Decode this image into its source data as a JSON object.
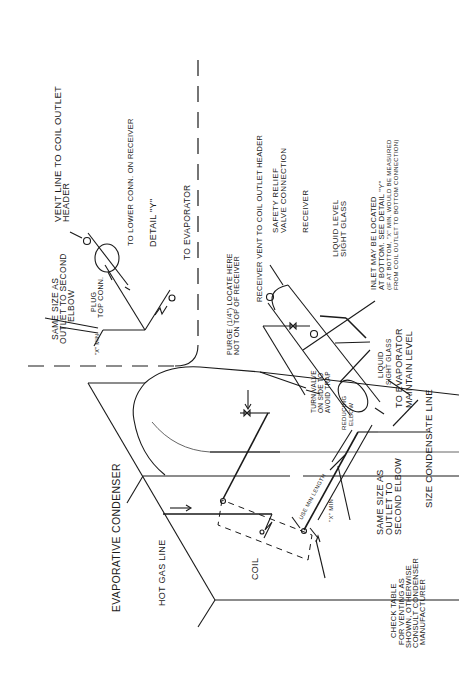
{
  "diagram": {
    "orientation": "rotated 90 degrees counter-clockwise",
    "labels": {
      "evaporative_condenser": "EVAPORATIVE CONDENSER",
      "hot_gas_line": "HOT GAS LINE",
      "coil": "COIL",
      "check_table": [
        "CHECK TABLE",
        "FOR VENTING AS",
        "SHOWN, OTHERWISE",
        "CONSULT CONDENSER",
        "MANUFACTURER"
      ],
      "same_size_bottom": [
        "SAME SIZE AS",
        "OUTLET TO",
        "SECOND ELBOW"
      ],
      "size_condensate_line": "SIZE CONDENSATE LINE",
      "use_min_length": "USE MIN LENGTH",
      "x_min_bottom": "\"X\" MIN",
      "reducing_elbow": [
        "REDUCING",
        "ELBOW"
      ],
      "turn_valve": [
        "TURN VALVE",
        "ON SIDE TO",
        "AVOID TRAP"
      ],
      "liquid_sight_glass": [
        "LIQUID",
        "SIGHT GLASS"
      ],
      "to_evaporator_maintain": [
        "TO EVAPORATOR",
        "MAINTAIN LEVEL"
      ],
      "purge": [
        "PURGE (1/4\") LOCATE HERE",
        "NOT ON TOP OF RECEIVER"
      ],
      "receiver_vent": "RECEIVER VENT TO COIL OUTLET HEADER",
      "safety_relief": [
        "SAFETY RELIEF",
        "VALVE CONNECTION"
      ],
      "receiver": "RECEIVER",
      "liquid_level_sight_glass": [
        "LIQUID LEVEL",
        "SIGHT GLASS"
      ],
      "inlet_note": [
        "INLET MAY BE LOCATED",
        "AT BOTTOM. SEE DETAIL \"Y\"",
        "(IF AT BOTTOM, \"X\" MIN. WOULD BE MEASURED",
        "FROM COIL OUTLET TO BOTTOM CONNECTION)"
      ],
      "vent_line": [
        "VENT LINE TO COIL OUTLET",
        "HEADER"
      ],
      "to_lower_conn": "TO LOWER CONN. ON RECEIVER",
      "detail_y": "DETAIL \"Y\"",
      "to_evaporator_detail": "TO EVAPORATOR",
      "same_size_top": [
        "SAME SIZE AS",
        "OUTLET TO SECOND",
        "ELBOW"
      ],
      "plug_top_conn": [
        "PLUG",
        "TOP CONN."
      ],
      "x_min_top": "\"X\" MIN."
    }
  }
}
